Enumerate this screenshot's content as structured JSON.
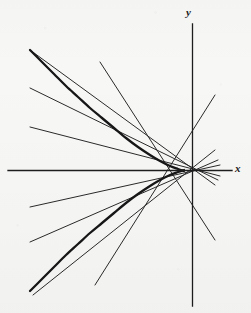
{
  "figure": {
    "kind": "geometry-diagram",
    "caption_visible": false,
    "background_color": "#f7f7f6",
    "ink_color": "#1b1b1b",
    "width": 251,
    "height": 313
  },
  "axes": {
    "x_label": "x",
    "y_label": "y",
    "x_axis": {
      "y": 170.5,
      "x_start": 8,
      "x_end": 232,
      "stroke_width": 1.3
    },
    "y_axis": {
      "x": 192.5,
      "y_start": 24,
      "y_end": 306,
      "stroke_width": 1.3
    },
    "origin": {
      "x": 192.5,
      "y": 170.5
    },
    "ticks": [],
    "gridlines": false
  },
  "chart_data": {
    "type": "line",
    "title": "",
    "xlabel": "x",
    "ylabel": "y",
    "grid": false,
    "legend": "none",
    "curves": [
      {
        "name": "parabola",
        "role": "conic",
        "opens": "left",
        "stroke_width": 2.3,
        "vertex_px": {
          "x": 186,
          "y": 171
        },
        "axis_of_symmetry": "x-axis",
        "points_px": [
          [
            30,
            50
          ],
          [
            42,
            62
          ],
          [
            54,
            74
          ],
          [
            66,
            86
          ],
          [
            78,
            97
          ],
          [
            90,
            108
          ],
          [
            102,
            118
          ],
          [
            114,
            128
          ],
          [
            126,
            138
          ],
          [
            138,
            147
          ],
          [
            150,
            155
          ],
          [
            160,
            161
          ],
          [
            170,
            166
          ],
          [
            178,
            169
          ],
          [
            184,
            171
          ]
        ],
        "mirror": true
      }
    ],
    "lines": [
      {
        "name": "line-1",
        "role": "pencil-through-pole",
        "stroke_width": 1.0,
        "from_px": [
          30,
          50
        ],
        "to_px": [
          215,
          185
        ]
      },
      {
        "name": "line-2",
        "role": "pencil-through-pole",
        "stroke_width": 1.0,
        "from_px": [
          30,
          88
        ],
        "to_px": [
          218,
          180
        ]
      },
      {
        "name": "line-3",
        "role": "pencil-through-pole",
        "stroke_width": 1.0,
        "from_px": [
          30,
          127
        ],
        "to_px": [
          220,
          176
        ]
      },
      {
        "name": "line-4",
        "role": "pencil-through-pole",
        "stroke_width": 1.0,
        "from_px": [
          30,
          207
        ],
        "to_px": [
          220,
          165
        ]
      },
      {
        "name": "line-5",
        "role": "pencil-through-pole",
        "stroke_width": 1.0,
        "from_px": [
          30,
          242
        ],
        "to_px": [
          218,
          160
        ]
      },
      {
        "name": "line-6",
        "role": "pencil-through-pole",
        "stroke_width": 1.0,
        "from_px": [
          33,
          295
        ],
        "to_px": [
          215,
          150
        ]
      },
      {
        "name": "line-7",
        "role": "pencil-through-pole-steep",
        "stroke_width": 1.0,
        "from_px": [
          215,
          95
        ],
        "to_px": [
          95,
          285
        ]
      },
      {
        "name": "line-8",
        "role": "pencil-through-pole-steep",
        "stroke_width": 1.0,
        "from_px": [
          100,
          62
        ],
        "to_px": [
          215,
          240
        ]
      }
    ],
    "pole": {
      "name": "common-point",
      "px": [
        184,
        171
      ],
      "label": "",
      "marker": false
    }
  }
}
